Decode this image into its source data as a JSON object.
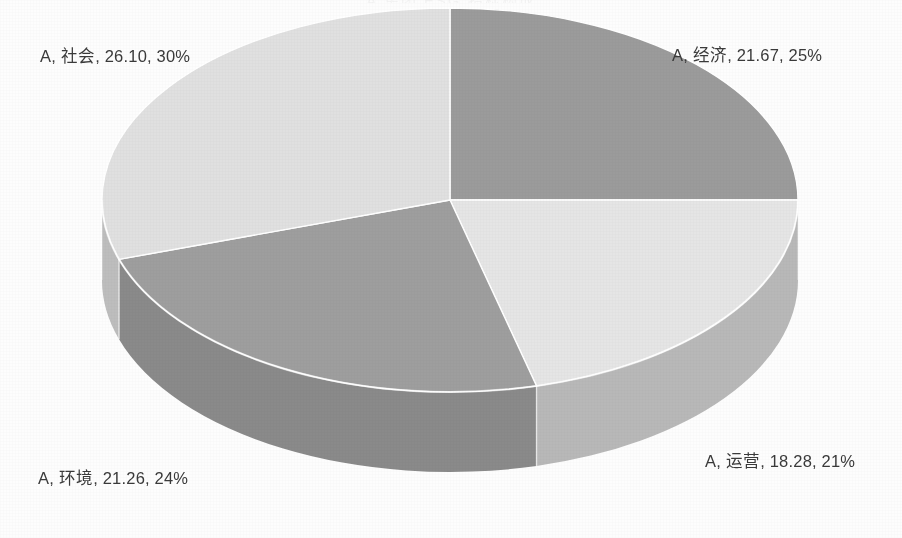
{
  "chart": {
    "title_clipped": "A 集团 ESG 指标构成",
    "background_color": "#fdfdfd"
  },
  "chart_data": {
    "type": "pie",
    "title": "",
    "three_d": true,
    "legend_position": "none",
    "label_format": "series, category, value, percent",
    "series_name": "A",
    "categories": [
      "经济",
      "运营",
      "环境",
      "社会"
    ],
    "values": [
      21.67,
      18.28,
      21.26,
      26.1
    ],
    "percents": [
      25,
      21,
      24,
      30
    ],
    "colors": [
      "#9b9b9b",
      "#e5e5e5",
      "#9e9e9e",
      "#e0e0e0"
    ],
    "side_colors": [
      "#848484",
      "#b8b8b8",
      "#8a8a8a",
      "#bdbdbd"
    ],
    "slices": [
      {
        "label": "A, 经济, 21.67, 25%",
        "name": "经济",
        "value": 21.67,
        "percent": 25,
        "color": "#9b9b9b"
      },
      {
        "label": "A, 运营, 18.28, 21%",
        "name": "运营",
        "value": 18.28,
        "percent": 21,
        "color": "#e5e5e5"
      },
      {
        "label": "A, 环境, 21.26, 24%",
        "name": "环境",
        "value": 21.26,
        "percent": 24,
        "color": "#9e9e9e"
      },
      {
        "label": "A, 社会, 26.10, 30%",
        "name": "社会",
        "value": 26.1,
        "percent": 30,
        "color": "#e0e0e0"
      }
    ],
    "total_value": 87.31,
    "ylabel": "",
    "xlabel": ""
  },
  "labels": {
    "shehui": "A, 社会, 26.10, 30%",
    "jingji": "A, 经济, 21.67, 25%",
    "yunying": "A, 运营, 18.28, 21%",
    "huanjing": "A, 环境, 21.26, 24%"
  }
}
